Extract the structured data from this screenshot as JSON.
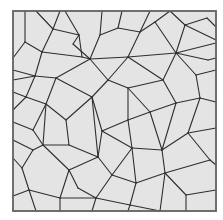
{
  "figure": {
    "title": "",
    "colors": {
      "background": "#ffffff",
      "tile_fill": "#e4e4e4",
      "edge": "#2e2e2e",
      "frame": "#6a6a6a"
    },
    "frame": {
      "x": 13,
      "y": 11,
      "width": 203,
      "height": 200
    },
    "edges": [
      [
        25,
        11,
        25,
        42
      ],
      [
        25,
        42,
        13,
        58
      ],
      [
        25,
        42,
        42,
        52
      ],
      [
        36,
        11,
        53,
        29
      ],
      [
        53,
        29,
        42,
        52
      ],
      [
        53,
        29,
        79,
        35
      ],
      [
        79,
        35,
        65,
        11
      ],
      [
        79,
        35,
        82,
        57
      ],
      [
        82,
        57,
        42,
        52
      ],
      [
        82,
        57,
        90,
        59
      ],
      [
        42,
        52,
        35,
        76
      ],
      [
        35,
        76,
        13,
        70
      ],
      [
        35,
        76,
        26,
        97
      ],
      [
        13,
        92,
        26,
        97
      ],
      [
        26,
        97,
        13,
        110
      ],
      [
        35,
        76,
        56,
        78
      ],
      [
        56,
        78,
        90,
        59
      ],
      [
        90,
        59,
        73,
        44
      ],
      [
        73,
        44,
        79,
        35
      ],
      [
        90,
        59,
        100,
        35
      ],
      [
        100,
        35,
        102,
        11
      ],
      [
        100,
        35,
        118,
        28
      ],
      [
        118,
        28,
        122,
        11
      ],
      [
        118,
        28,
        140,
        32
      ],
      [
        140,
        32,
        128,
        57
      ],
      [
        128,
        57,
        90,
        59
      ],
      [
        128,
        57,
        176,
        53
      ],
      [
        140,
        32,
        150,
        11
      ],
      [
        140,
        32,
        155,
        22
      ],
      [
        155,
        22,
        176,
        53
      ],
      [
        155,
        22,
        170,
        11
      ],
      [
        176,
        53,
        185,
        25
      ],
      [
        185,
        25,
        170,
        11
      ],
      [
        185,
        25,
        207,
        18
      ],
      [
        207,
        18,
        216,
        27
      ],
      [
        185,
        25,
        216,
        40
      ],
      [
        176,
        53,
        216,
        43
      ],
      [
        176,
        53,
        208,
        60
      ],
      [
        208,
        60,
        216,
        58
      ],
      [
        176,
        53,
        196,
        75
      ],
      [
        196,
        75,
        216,
        70
      ],
      [
        196,
        75,
        200,
        98
      ],
      [
        200,
        98,
        216,
        102
      ],
      [
        176,
        53,
        163,
        80
      ],
      [
        163,
        80,
        128,
        57
      ],
      [
        163,
        80,
        176,
        103
      ],
      [
        176,
        103,
        200,
        98
      ],
      [
        176,
        103,
        150,
        112
      ],
      [
        150,
        112,
        128,
        88
      ],
      [
        128,
        88,
        163,
        80
      ],
      [
        128,
        88,
        108,
        80
      ],
      [
        108,
        80,
        128,
        57
      ],
      [
        108,
        80,
        90,
        59
      ],
      [
        108,
        80,
        92,
        97
      ],
      [
        92,
        97,
        56,
        78
      ],
      [
        92,
        97,
        66,
        120
      ],
      [
        56,
        78,
        46,
        104
      ],
      [
        46,
        104,
        26,
        97
      ],
      [
        46,
        104,
        66,
        120
      ],
      [
        66,
        120,
        69,
        145
      ],
      [
        69,
        145,
        43,
        145
      ],
      [
        43,
        145,
        46,
        104
      ],
      [
        43,
        145,
        33,
        150
      ],
      [
        33,
        150,
        13,
        140
      ],
      [
        33,
        150,
        22,
        168
      ],
      [
        22,
        168,
        13,
        158
      ],
      [
        22,
        168,
        29,
        190
      ],
      [
        29,
        190,
        13,
        196
      ],
      [
        29,
        190,
        36,
        211
      ],
      [
        29,
        190,
        60,
        198
      ],
      [
        60,
        198,
        60,
        211
      ],
      [
        60,
        198,
        69,
        170
      ],
      [
        69,
        170,
        43,
        145
      ],
      [
        69,
        170,
        98,
        157
      ],
      [
        98,
        157,
        69,
        145
      ],
      [
        98,
        157,
        92,
        97
      ],
      [
        98,
        157,
        102,
        131
      ],
      [
        102,
        131,
        92,
        97
      ],
      [
        102,
        131,
        128,
        120
      ],
      [
        128,
        120,
        150,
        112
      ],
      [
        128,
        120,
        128,
        88
      ],
      [
        128,
        120,
        132,
        148
      ],
      [
        132,
        148,
        102,
        131
      ],
      [
        132,
        148,
        162,
        150
      ],
      [
        162,
        150,
        150,
        112
      ],
      [
        162,
        150,
        176,
        103
      ],
      [
        162,
        150,
        188,
        133
      ],
      [
        188,
        133,
        200,
        98
      ],
      [
        188,
        133,
        216,
        128
      ],
      [
        188,
        133,
        210,
        160
      ],
      [
        210,
        160,
        216,
        165
      ],
      [
        162,
        150,
        165,
        173
      ],
      [
        165,
        173,
        210,
        160
      ],
      [
        165,
        173,
        186,
        195
      ],
      [
        186,
        195,
        216,
        190
      ],
      [
        186,
        195,
        186,
        211
      ],
      [
        165,
        173,
        136,
        183
      ],
      [
        136,
        183,
        132,
        148
      ],
      [
        136,
        183,
        112,
        175
      ],
      [
        112,
        175,
        98,
        157
      ],
      [
        112,
        175,
        132,
        148
      ],
      [
        112,
        175,
        96,
        198
      ],
      [
        96,
        198,
        60,
        198
      ],
      [
        96,
        198,
        92,
        211
      ],
      [
        96,
        198,
        130,
        205
      ],
      [
        130,
        205,
        136,
        183
      ],
      [
        130,
        205,
        128,
        211
      ],
      [
        130,
        205,
        160,
        211
      ],
      [
        165,
        173,
        160,
        211
      ],
      [
        69,
        170,
        78,
        188
      ],
      [
        78,
        188,
        96,
        198
      ],
      [
        13,
        122,
        33,
        130
      ],
      [
        33,
        130,
        46,
        104
      ],
      [
        33,
        130,
        43,
        145
      ],
      [
        13,
        80,
        35,
        76
      ],
      [
        60,
        11,
        53,
        29
      ]
    ]
  }
}
